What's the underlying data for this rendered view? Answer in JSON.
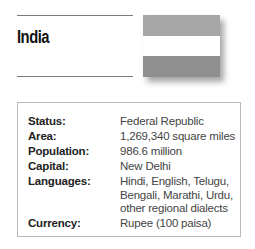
{
  "country": {
    "name": "India",
    "flag": {
      "icon": "india-flag-icon",
      "stripes": [
        "#a6a6a6",
        "#ffffff",
        "#8f8f8f"
      ],
      "emblem": "ashoka-chakra-icon"
    }
  },
  "facts": [
    {
      "label": "Status:",
      "value": "Federal Republic"
    },
    {
      "label": "Area:",
      "value": "1,269,340 square miles"
    },
    {
      "label": "Population:",
      "value": "986.6 million"
    },
    {
      "label": "Capital:",
      "value": "New Delhi"
    },
    {
      "label": "Languages:",
      "value_lines": [
        "Hindi, English, Telugu,",
        "Bengali, Marathi, Urdu,",
        "other regional dialects"
      ]
    },
    {
      "label": "Currency:",
      "value": "Rupee (100 paisa)"
    }
  ]
}
